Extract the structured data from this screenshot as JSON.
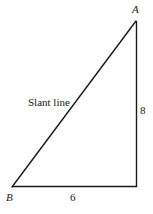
{
  "diagram": {
    "type": "right-triangle",
    "line_color": "#1a1a1a",
    "vertices": {
      "A": {
        "label": "A",
        "x": 136,
        "y": 21
      },
      "C": {
        "label": "",
        "x": 137,
        "y": 186
      },
      "B": {
        "label": "B",
        "x": 12,
        "y": 187
      }
    },
    "sides": {
      "vertical": {
        "label": "8"
      },
      "horizontal": {
        "label": "6"
      },
      "hypotenuse": {
        "label": "Slant line"
      }
    }
  }
}
